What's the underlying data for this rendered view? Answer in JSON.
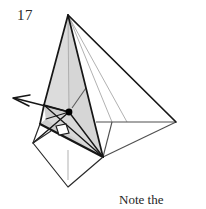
{
  "figure": {
    "problem_number": "17",
    "caption_line_1": "Note the",
    "caption_line_2": "right angle.",
    "caption_full": "Note the right angle."
  },
  "colors": {
    "background": "#ffffff",
    "stroke_dark": "#1a1a1a",
    "stroke_medium": "#555555",
    "stroke_light": "#a8a8a8",
    "face_shade": "#dddddd",
    "face_shade_dark": "#cfcfcf",
    "text": "#262626",
    "vertex_dot": "#000000"
  },
  "geometry": {
    "type": "3d-solid-diagram",
    "description": "Pyramid with shaded face, projecting wing plane, base kite, perpendicular foot marked with a right-angle square, and an arrow indicating a direction.",
    "points": {
      "apex": [
        68,
        15
      ],
      "left_mid": [
        44,
        105
      ],
      "base_right": [
        103,
        157
      ],
      "wing_tip": [
        176,
        122
      ],
      "wing_joint": [
        100,
        122
      ],
      "kite_left": [
        33,
        143
      ],
      "kite_bottom": [
        68,
        187
      ],
      "kite_right": [
        103,
        157
      ],
      "kite_top": [
        46,
        118
      ],
      "foot_dot": [
        69,
        112
      ],
      "arrow_tip": [
        13,
        98
      ],
      "arrow_tail": [
        69,
        112
      ],
      "right_angle_marker": [
        62,
        130
      ]
    },
    "markers": {
      "right_angle_square_size": 9,
      "vertex_dot_radius": 3.2,
      "arrow_head_length": 10
    }
  }
}
